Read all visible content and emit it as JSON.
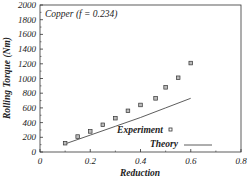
{
  "chart_data": {
    "type": "scatter",
    "title": "",
    "annotation": "Copper (f = 0.234)",
    "xlabel": "Reduction",
    "ylabel": "Rolling Torque (Nm)",
    "xlim": [
      0,
      0.8
    ],
    "ylim": [
      0,
      2000
    ],
    "x_ticks": [
      "0",
      "0.2",
      "0.4",
      "0.6",
      "0.8"
    ],
    "y_ticks": [
      "0",
      "200",
      "400",
      "600",
      "800",
      "1000",
      "1200",
      "1400",
      "1600",
      "1800",
      "2000"
    ],
    "grid": false,
    "legend_position": "lower right",
    "series": [
      {
        "name": "Experiment",
        "marker": "square",
        "x": [
          0.1,
          0.15,
          0.2,
          0.25,
          0.3,
          0.35,
          0.4,
          0.46,
          0.5,
          0.55,
          0.6
        ],
        "y": [
          120,
          210,
          280,
          370,
          460,
          560,
          640,
          730,
          880,
          1010,
          1210
        ]
      },
      {
        "name": "Theory",
        "marker": "line",
        "x": [
          0.1,
          0.2,
          0.3,
          0.4,
          0.5,
          0.6
        ],
        "y": [
          110,
          230,
          350,
          470,
          600,
          730
        ]
      }
    ]
  }
}
